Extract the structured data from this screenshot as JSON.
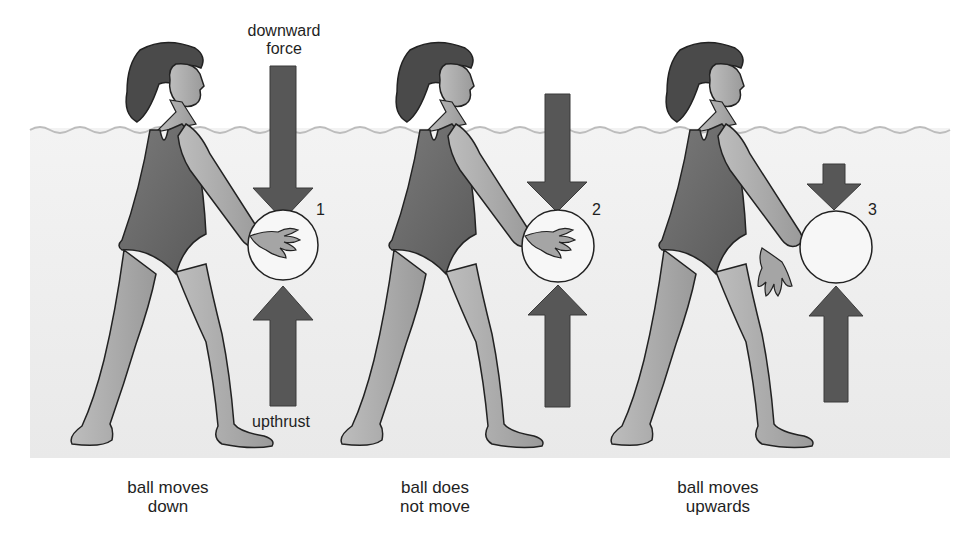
{
  "labels": {
    "downward_force_line1": "downward",
    "downward_force_line2": "force",
    "upthrust": "upthrust"
  },
  "scenes": [
    {
      "number": "1",
      "caption_line1": "ball moves",
      "caption_line2": "down",
      "downward_arrow_length": "long",
      "upthrust_arrow_length": "long",
      "hand_on_ball": true
    },
    {
      "number": "2",
      "caption_line1": "ball does",
      "caption_line2": "not move",
      "downward_arrow_length": "medium",
      "upthrust_arrow_length": "medium",
      "hand_on_ball": true
    },
    {
      "number": "3",
      "caption_line1": "ball moves",
      "caption_line2": "upwards",
      "downward_arrow_length": "short",
      "upthrust_arrow_length": "medium",
      "hand_on_ball": false
    }
  ],
  "colors": {
    "arrow": "#555555",
    "outline": "#222222",
    "water": "#ececec",
    "surface": "#bdbdbd",
    "skin": "#a9a9a9",
    "swimsuit": "#6a6a6a",
    "hair": "#4a4a4a"
  }
}
